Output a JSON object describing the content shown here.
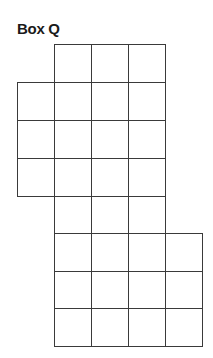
{
  "title": "Box Q",
  "grid": {
    "stroke_color": "#3a3a3a",
    "col_lines_x": [
      17,
      54,
      91,
      128,
      165,
      202
    ],
    "row_lines_y": [
      44,
      82,
      120,
      158,
      196,
      233,
      271,
      308,
      346
    ],
    "rows": [
      {
        "row": 0,
        "cols": [
          1,
          2,
          3
        ]
      },
      {
        "row": 1,
        "cols": [
          0,
          1,
          2,
          3
        ]
      },
      {
        "row": 2,
        "cols": [
          0,
          1,
          2,
          3
        ]
      },
      {
        "row": 3,
        "cols": [
          0,
          1,
          2,
          3
        ]
      },
      {
        "row": 4,
        "cols": [
          1,
          2,
          3
        ]
      },
      {
        "row": 5,
        "cols": [
          1,
          2,
          3,
          4
        ]
      },
      {
        "row": 6,
        "cols": [
          1,
          2,
          3,
          4
        ]
      },
      {
        "row": 7,
        "cols": [
          1,
          2,
          3,
          4
        ]
      }
    ],
    "total_cells": 28
  }
}
